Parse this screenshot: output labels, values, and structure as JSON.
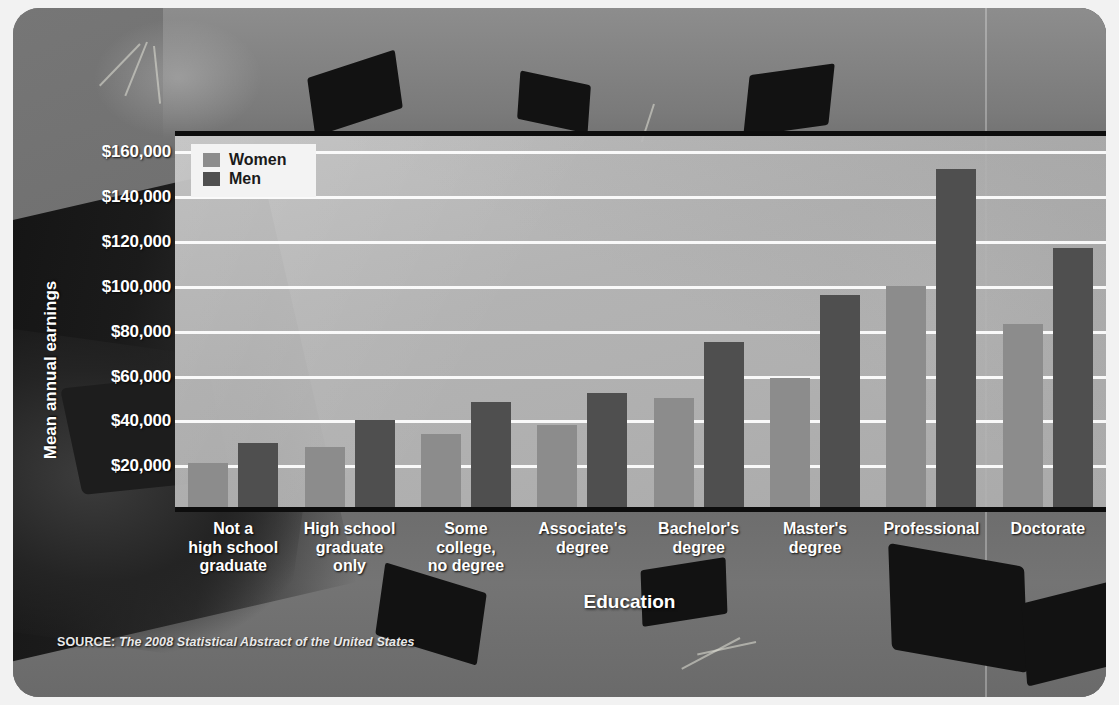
{
  "figure": {
    "source_prefix": "SOURCE:",
    "source_text": "The 2008 Statistical Abstract of the United States"
  },
  "legend": {
    "position": "top-left-inside",
    "items": [
      {
        "label": "Women",
        "color": "#8c8c8c"
      },
      {
        "label": "Men",
        "color": "#4f4f4f"
      }
    ]
  },
  "chart_data": {
    "type": "bar",
    "title": "",
    "xlabel": "Education",
    "ylabel": "Mean annual earnings",
    "ylim": [
      0,
      170000
    ],
    "ytick_values": [
      20000,
      40000,
      60000,
      80000,
      100000,
      120000,
      140000,
      160000
    ],
    "ytick_labels": [
      "$20,000",
      "$40,000",
      "$60,000",
      "$80,000",
      "$100,000",
      "$120,000",
      "$140,000",
      "$160,000"
    ],
    "grid": true,
    "grid_axis": "y",
    "legend_position": "upper left",
    "categories": [
      "Not a\nhigh school\ngraduate",
      "High school\ngraduate\nonly",
      "Some\ncollege,\nno degree",
      "Associate's\ndegree",
      "Bachelor's\ndegree",
      "Master's\ndegree",
      "Professional",
      "Doctorate"
    ],
    "category_lines": [
      [
        "Not a",
        "high school",
        "graduate"
      ],
      [
        "High school",
        "graduate",
        "only"
      ],
      [
        "Some",
        "college,",
        "no degree"
      ],
      [
        "Associate's",
        "degree"
      ],
      [
        "Bachelor's",
        "degree"
      ],
      [
        "Master's",
        "degree"
      ],
      [
        "Professional"
      ],
      [
        "Doctorate"
      ]
    ],
    "series": [
      {
        "name": "Women",
        "color": "#8c8c8c",
        "values": [
          22000,
          29000,
          35000,
          39000,
          51000,
          60000,
          101000,
          84000
        ]
      },
      {
        "name": "Men",
        "color": "#4f4f4f",
        "values": [
          31000,
          41000,
          49000,
          53000,
          76000,
          97000,
          153000,
          118000
        ]
      }
    ]
  }
}
